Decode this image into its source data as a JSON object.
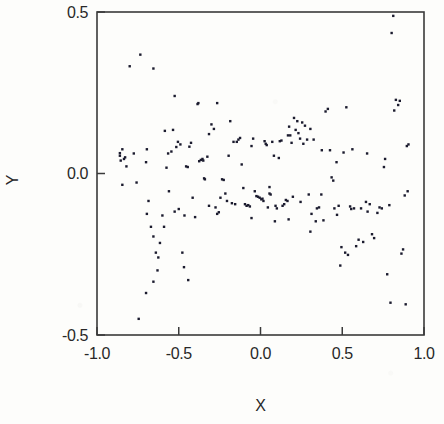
{
  "figure": {
    "background_color": "#fdfdfb",
    "ink_color": "#282828",
    "marker_color": "#1b1b2e"
  },
  "axes": {
    "x_title": "X",
    "y_title": "Y",
    "x_ticks": [
      "-1.0",
      "-0.5",
      "0.0",
      "0.5",
      "1.0"
    ],
    "y_ticks": [
      "0.5",
      "0.0",
      "-0.5"
    ]
  },
  "chart_data": {
    "type": "scatter",
    "title": "",
    "xlabel": "X",
    "ylabel": "Y",
    "xlim": [
      -1.0,
      1.0
    ],
    "ylim": [
      -0.5,
      0.5
    ],
    "xticks": [
      -1.0,
      -0.5,
      0.0,
      0.5,
      1.0
    ],
    "yticks": [
      -0.5,
      0.0,
      0.5
    ],
    "xticklabels": [
      "-1.0",
      "-0.5",
      "0.0",
      "0.5",
      "1.0"
    ],
    "yticklabels": [
      "-0.5",
      "0.0",
      "0.5"
    ],
    "grid": false,
    "legend": null,
    "marker": "square",
    "marker_size": 2.4,
    "n_points": 186,
    "series": [
      {
        "name": "observations",
        "color": "#1b1b2e",
        "points": [
          [
            -0.86,
            0.055
          ],
          [
            -0.855,
            0.04
          ],
          [
            -0.845,
            0.075
          ],
          [
            -0.835,
            0.045
          ],
          [
            -0.828,
            0.05
          ],
          [
            -0.82,
            0.022
          ],
          [
            -0.845,
            -0.035
          ],
          [
            -0.86,
            0.063
          ],
          [
            -0.8,
            0.332
          ],
          [
            -0.735,
            0.368
          ],
          [
            -0.7,
            0.035
          ],
          [
            -0.695,
            0.075
          ],
          [
            -0.655,
            0.325
          ],
          [
            -0.685,
            -0.085
          ],
          [
            -0.67,
            -0.165
          ],
          [
            -0.655,
            -0.195
          ],
          [
            -0.695,
            -0.125
          ],
          [
            -0.64,
            -0.245
          ],
          [
            -0.625,
            -0.26
          ],
          [
            -0.63,
            -0.3
          ],
          [
            -0.655,
            -0.335
          ],
          [
            -0.7,
            -0.37
          ],
          [
            -0.745,
            -0.45
          ],
          [
            -0.615,
            -0.215
          ],
          [
            -0.6,
            -0.13
          ],
          [
            -0.575,
            0.018
          ],
          [
            -0.59,
            -0.165
          ],
          [
            -0.565,
            0.062
          ],
          [
            -0.545,
            0.068
          ],
          [
            -0.56,
            -0.055
          ],
          [
            -0.525,
            0.24
          ],
          [
            -0.535,
            0.135
          ],
          [
            -0.515,
            0.082
          ],
          [
            -0.505,
            0.098
          ],
          [
            -0.5,
            -0.11
          ],
          [
            -0.49,
            0.09
          ],
          [
            -0.465,
            -0.13
          ],
          [
            -0.455,
            0.022
          ],
          [
            -0.445,
            0.02
          ],
          [
            -0.435,
            0.083
          ],
          [
            -0.425,
            0.095
          ],
          [
            -0.415,
            -0.075
          ],
          [
            -0.4,
            -0.135
          ],
          [
            -0.385,
            0.215
          ],
          [
            -0.38,
            0.218
          ],
          [
            -0.375,
            0.038
          ],
          [
            -0.365,
            0.042
          ],
          [
            -0.355,
            0.045
          ],
          [
            -0.35,
            0.04
          ],
          [
            -0.345,
            -0.015
          ],
          [
            -0.34,
            -0.018
          ],
          [
            -0.325,
            0.052
          ],
          [
            -0.315,
            0.122
          ],
          [
            -0.3,
            0.152
          ],
          [
            -0.285,
            0.138
          ],
          [
            -0.275,
            -0.105
          ],
          [
            -0.265,
            -0.125
          ],
          [
            -0.255,
            -0.12
          ],
          [
            -0.245,
            -0.075
          ],
          [
            -0.235,
            -0.018
          ],
          [
            -0.225,
            -0.02
          ],
          [
            -0.215,
            -0.062
          ],
          [
            -0.205,
            -0.085
          ],
          [
            -0.195,
            0.055
          ],
          [
            -0.185,
            0.162
          ],
          [
            -0.175,
            -0.092
          ],
          [
            -0.165,
            0.098
          ],
          [
            -0.155,
            -0.095
          ],
          [
            -0.145,
            0.098
          ],
          [
            -0.135,
            0.105
          ],
          [
            -0.125,
            0.11
          ],
          [
            -0.115,
            0.028
          ],
          [
            -0.105,
            -0.045
          ],
          [
            -0.095,
            -0.095
          ],
          [
            -0.085,
            -0.1
          ],
          [
            -0.075,
            -0.098
          ],
          [
            -0.065,
            -0.102
          ],
          [
            -0.055,
            0.085
          ],
          [
            -0.045,
            0.108
          ],
          [
            -0.035,
            -0.055
          ],
          [
            -0.025,
            -0.07
          ],
          [
            -0.015,
            -0.072
          ],
          [
            -0.005,
            -0.075
          ],
          [
            0.005,
            -0.08
          ],
          [
            0.012,
            -0.078
          ],
          [
            0.018,
            -0.085
          ],
          [
            0.025,
            0.1
          ],
          [
            0.032,
            0.092
          ],
          [
            0.038,
            0.088
          ],
          [
            0.045,
            -0.105
          ],
          [
            0.055,
            -0.062
          ],
          [
            0.062,
            -0.065
          ],
          [
            0.072,
            0.098
          ],
          [
            0.082,
            0.055
          ],
          [
            0.092,
            -0.1
          ],
          [
            0.1,
            -0.108
          ],
          [
            0.112,
            0.048
          ],
          [
            0.118,
            0.1
          ],
          [
            0.128,
            0.102
          ],
          [
            0.135,
            -0.1
          ],
          [
            0.145,
            -0.095
          ],
          [
            0.155,
            -0.082
          ],
          [
            0.165,
            -0.085
          ],
          [
            0.175,
            0.145
          ],
          [
            0.182,
            0.118
          ],
          [
            0.19,
            0.095
          ],
          [
            0.198,
            -0.072
          ],
          [
            0.205,
            0.172
          ],
          [
            0.215,
            0.135
          ],
          [
            0.225,
            0.162
          ],
          [
            0.232,
            0.125
          ],
          [
            0.245,
            -0.088
          ],
          [
            0.255,
            0.158
          ],
          [
            0.262,
            0.092
          ],
          [
            0.272,
            0.148
          ],
          [
            0.285,
            0.105
          ],
          [
            0.295,
            -0.065
          ],
          [
            0.305,
            0.138
          ],
          [
            0.312,
            -0.125
          ],
          [
            0.325,
            0.105
          ],
          [
            0.338,
            -0.148
          ],
          [
            0.345,
            -0.108
          ],
          [
            0.358,
            -0.105
          ],
          [
            0.372,
            -0.065
          ],
          [
            0.385,
            -0.145
          ],
          [
            0.398,
            0.192
          ],
          [
            0.412,
            0.2
          ],
          [
            0.425,
            0.072
          ],
          [
            0.435,
            -0.012
          ],
          [
            0.445,
            -0.022
          ],
          [
            0.452,
            -0.108
          ],
          [
            0.465,
            0.035
          ],
          [
            0.478,
            -0.1
          ],
          [
            0.488,
            -0.285
          ],
          [
            0.495,
            -0.228
          ],
          [
            0.508,
            0.065
          ],
          [
            0.518,
            -0.245
          ],
          [
            0.525,
            0.205
          ],
          [
            0.535,
            -0.252
          ],
          [
            0.548,
            -0.102
          ],
          [
            0.562,
            0.075
          ],
          [
            0.572,
            -0.108
          ],
          [
            0.585,
            -0.225
          ],
          [
            0.6,
            -0.205
          ],
          [
            0.615,
            -0.108
          ],
          [
            0.628,
            -0.212
          ],
          [
            0.645,
            -0.088
          ],
          [
            0.655,
            -0.118
          ],
          [
            0.668,
            -0.095
          ],
          [
            0.682,
            -0.188
          ],
          [
            0.695,
            -0.2
          ],
          [
            0.715,
            -0.122
          ],
          [
            0.728,
            -0.105
          ],
          [
            0.742,
            -0.108
          ],
          [
            0.755,
            0.02
          ],
          [
            0.762,
            0.045
          ],
          [
            0.775,
            -0.312
          ],
          [
            0.788,
            -0.098
          ],
          [
            0.795,
            -0.4
          ],
          [
            0.802,
            0.435
          ],
          [
            0.812,
            0.488
          ],
          [
            0.818,
            0.195
          ],
          [
            0.828,
            0.228
          ],
          [
            0.842,
            0.212
          ],
          [
            0.852,
            0.225
          ],
          [
            0.862,
            -0.248
          ],
          [
            0.872,
            -0.235
          ],
          [
            0.882,
            -0.068
          ],
          [
            0.888,
            -0.405
          ],
          [
            0.895,
            0.085
          ],
          [
            0.9,
            -0.055
          ],
          [
            0.905,
            0.09
          ],
          [
            -0.775,
            0.062
          ],
          [
            -0.758,
            -0.028
          ],
          [
            -0.525,
            -0.118
          ],
          [
            -0.478,
            -0.245
          ],
          [
            -0.468,
            -0.29
          ],
          [
            -0.442,
            -0.33
          ],
          [
            -0.585,
            0.132
          ],
          [
            -0.265,
            0.218
          ],
          [
            0.055,
            -0.042
          ],
          [
            0.168,
            0.118
          ],
          [
            0.242,
            0.108
          ],
          [
            0.305,
            -0.18
          ],
          [
            0.375,
            0.072
          ],
          [
            0.468,
            -0.128
          ],
          [
            0.555,
            -0.11
          ],
          [
            0.652,
            0.062
          ],
          [
            0.172,
            -0.142
          ],
          [
            0.088,
            -0.148
          ],
          [
            -0.055,
            -0.138
          ],
          [
            -0.315,
            -0.1
          ]
        ]
      }
    ]
  }
}
